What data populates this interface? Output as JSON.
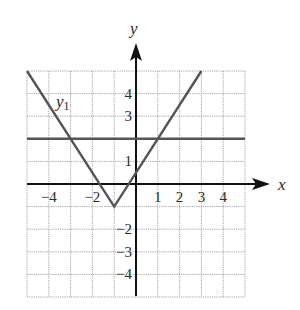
{
  "chart_data": {
    "type": "line",
    "title": "",
    "xlabel": "x",
    "ylabel": "y",
    "xlim": [
      -5,
      5
    ],
    "ylim": [
      -5,
      5
    ],
    "grid": true,
    "x_ticks": [
      -4,
      -2,
      1,
      2,
      3,
      4
    ],
    "y_ticks": [
      4,
      3,
      1,
      -2,
      -3,
      -4
    ],
    "x_tick_labels": [
      "−4",
      "−2",
      "1",
      "2",
      "3",
      "4"
    ],
    "y_tick_labels": [
      "4",
      "3",
      "1",
      "−2",
      "−3",
      "−4"
    ],
    "series": [
      {
        "name": "y1",
        "label": "y",
        "subscript": "1",
        "points": [
          [
            -5,
            5
          ],
          [
            -1,
            -1
          ],
          [
            3,
            5
          ]
        ],
        "description": "V-shaped absolute value graph with vertex at (-1, -1)"
      },
      {
        "name": "horizontal line",
        "points": [
          [
            -5,
            2
          ],
          [
            5,
            2
          ]
        ],
        "description": "Horizontal line y = 2"
      }
    ],
    "colors": {
      "curves": "#555555",
      "axes": "#111111",
      "grid": "#9a9a9a"
    }
  }
}
